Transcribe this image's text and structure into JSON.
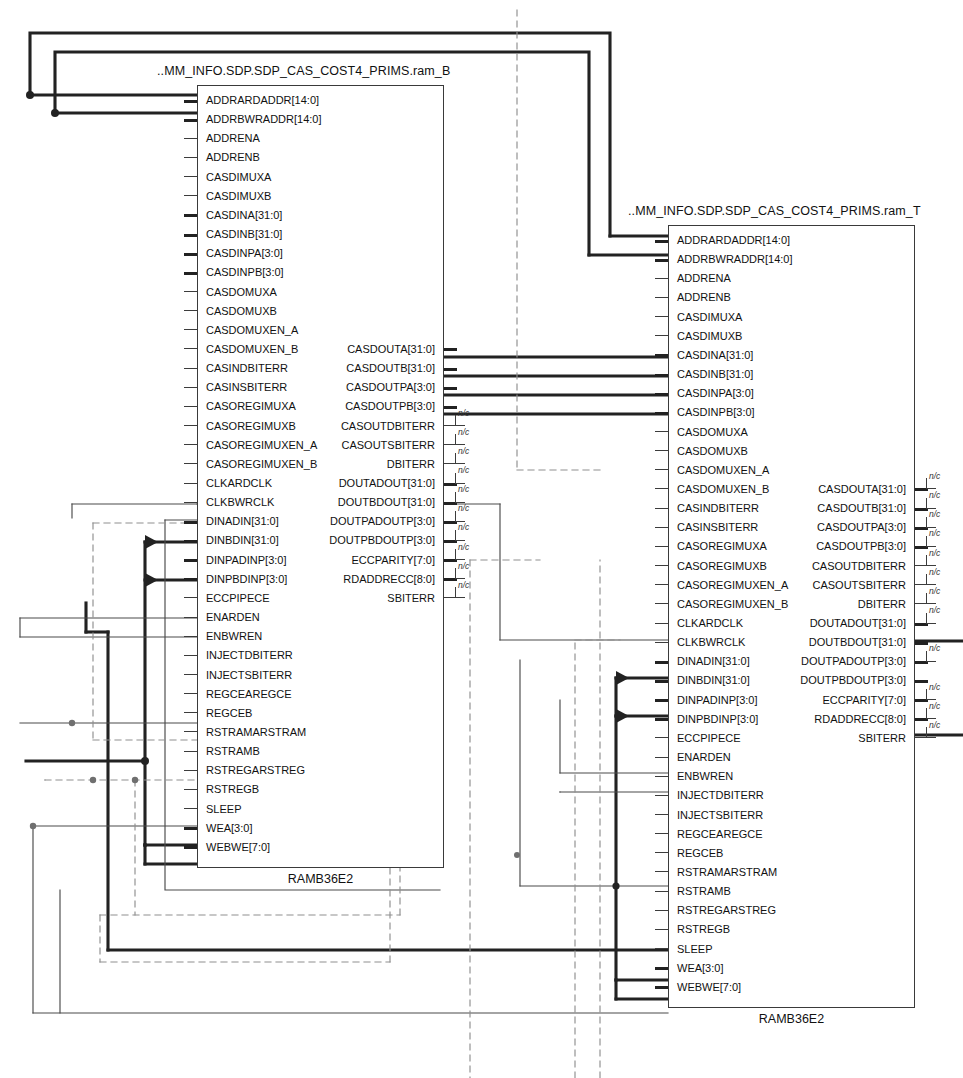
{
  "diagram": {
    "kind": "schematic",
    "tool_view": "RTL / synthesized netlist schematic",
    "cell_type": "RAMB36E2"
  },
  "blocks": [
    {
      "id": "ram_B",
      "title": "..MM_INFO.SDP.SDP_CAS_COST4_PRIMS.ram_B",
      "footer": "RAMB36E2",
      "x": 197,
      "y": 85,
      "w": 247,
      "h": 783,
      "inputs": [
        {
          "name": "ADDRARDADDR[14:0]",
          "bus": true,
          "wired": true
        },
        {
          "name": "ADDRBWRADDR[14:0]",
          "bus": true,
          "wired": true
        },
        {
          "name": "ADDRENA",
          "bus": false,
          "wired": false
        },
        {
          "name": "ADDRENB",
          "bus": false,
          "wired": false
        },
        {
          "name": "CASDIMUXA",
          "bus": false,
          "wired": false
        },
        {
          "name": "CASDIMUXB",
          "bus": false,
          "wired": false
        },
        {
          "name": "CASDINA[31:0]",
          "bus": true,
          "wired": false
        },
        {
          "name": "CASDINB[31:0]",
          "bus": true,
          "wired": false
        },
        {
          "name": "CASDINPA[3:0]",
          "bus": true,
          "wired": false
        },
        {
          "name": "CASDINPB[3:0]",
          "bus": true,
          "wired": false
        },
        {
          "name": "CASDOMUXA",
          "bus": false,
          "wired": false
        },
        {
          "name": "CASDOMUXB",
          "bus": false,
          "wired": false
        },
        {
          "name": "CASDOMUXEN_A",
          "bus": false,
          "wired": false
        },
        {
          "name": "CASDOMUXEN_B",
          "bus": false,
          "wired": false
        },
        {
          "name": "CASINDBITERR",
          "bus": false,
          "wired": false
        },
        {
          "name": "CASINSBITERR",
          "bus": false,
          "wired": false
        },
        {
          "name": "CASOREGIMUXA",
          "bus": false,
          "wired": false
        },
        {
          "name": "CASOREGIMUXB",
          "bus": false,
          "wired": false
        },
        {
          "name": "CASOREGIMUXEN_A",
          "bus": false,
          "wired": false
        },
        {
          "name": "CASOREGIMUXEN_B",
          "bus": false,
          "wired": false
        },
        {
          "name": "CLKARDCLK",
          "bus": false,
          "wired": true
        },
        {
          "name": "CLKBWRCLK",
          "bus": false,
          "wired": true
        },
        {
          "name": "DINADIN[31:0]",
          "bus": true,
          "wired": true
        },
        {
          "name": "DINBDIN[31:0]",
          "bus": true,
          "wired": false
        },
        {
          "name": "DINPADINP[3:0]",
          "bus": true,
          "wired": true
        },
        {
          "name": "DINPBDINP[3:0]",
          "bus": true,
          "wired": false
        },
        {
          "name": "ECCPIPECE",
          "bus": false,
          "wired": false
        },
        {
          "name": "ENARDEN",
          "bus": false,
          "wired": true
        },
        {
          "name": "ENBWREN",
          "bus": false,
          "wired": true
        },
        {
          "name": "INJECTDBITERR",
          "bus": false,
          "wired": false
        },
        {
          "name": "INJECTSBITERR",
          "bus": false,
          "wired": false
        },
        {
          "name": "REGCEAREGCE",
          "bus": false,
          "wired": true
        },
        {
          "name": "REGCEB",
          "bus": false,
          "wired": true
        },
        {
          "name": "RSTRAMARSTRAM",
          "bus": false,
          "wired": true
        },
        {
          "name": "RSTRAMB",
          "bus": false,
          "wired": true
        },
        {
          "name": "RSTREGARSTREG",
          "bus": false,
          "wired": false
        },
        {
          "name": "RSTREGB",
          "bus": false,
          "wired": false
        },
        {
          "name": "SLEEP",
          "bus": false,
          "wired": false
        },
        {
          "name": "WEA[3:0]",
          "bus": true,
          "wired": true
        },
        {
          "name": "WEBWE[7:0]",
          "bus": true,
          "wired": true
        }
      ],
      "outputs": [
        {
          "name": "CASDOUTA[31:0]",
          "row": 13,
          "bus": true,
          "nc": false
        },
        {
          "name": "CASDOUTB[31:0]",
          "row": 14,
          "bus": true,
          "nc": false
        },
        {
          "name": "CASDOUTPA[3:0]",
          "row": 15,
          "bus": true,
          "nc": false
        },
        {
          "name": "CASDOUTPB[3:0]",
          "row": 16,
          "bus": true,
          "nc": false
        },
        {
          "name": "CASOUTDBITERR",
          "row": 17,
          "bus": false,
          "nc": true
        },
        {
          "name": "CASOUTSBITERR",
          "row": 18,
          "bus": false,
          "nc": true
        },
        {
          "name": "DBITERR",
          "row": 19,
          "bus": false,
          "nc": true
        },
        {
          "name": "DOUTADOUT[31:0]",
          "row": 20,
          "bus": true,
          "nc": true
        },
        {
          "name": "DOUTBDOUT[31:0]",
          "row": 21,
          "bus": true,
          "nc": true
        },
        {
          "name": "DOUTPADOUTP[3:0]",
          "row": 22,
          "bus": true,
          "nc": true
        },
        {
          "name": "DOUTPBDOUTP[3:0]",
          "row": 23,
          "bus": true,
          "nc": true
        },
        {
          "name": "ECCPARITY[7:0]",
          "row": 24,
          "bus": true,
          "nc": true
        },
        {
          "name": "RDADDRECC[8:0]",
          "row": 25,
          "bus": true,
          "nc": true
        },
        {
          "name": "SBITERR",
          "row": 26,
          "bus": false,
          "nc": true
        }
      ]
    },
    {
      "id": "ram_T",
      "title": "..MM_INFO.SDP.SDP_CAS_COST4_PRIMS.ram_T",
      "footer": "RAMB36E2",
      "x": 668,
      "y": 225,
      "w": 247,
      "h": 783,
      "inputs": [
        {
          "name": "ADDRARDADDR[14:0]",
          "bus": true,
          "wired": true
        },
        {
          "name": "ADDRBWRADDR[14:0]",
          "bus": true,
          "wired": true
        },
        {
          "name": "ADDRENA",
          "bus": false,
          "wired": false
        },
        {
          "name": "ADDRENB",
          "bus": false,
          "wired": false
        },
        {
          "name": "CASDIMUXA",
          "bus": false,
          "wired": false
        },
        {
          "name": "CASDIMUXB",
          "bus": false,
          "wired": false
        },
        {
          "name": "CASDINA[31:0]",
          "bus": true,
          "wired": true
        },
        {
          "name": "CASDINB[31:0]",
          "bus": true,
          "wired": true
        },
        {
          "name": "CASDINPA[3:0]",
          "bus": true,
          "wired": true
        },
        {
          "name": "CASDINPB[3:0]",
          "bus": true,
          "wired": true
        },
        {
          "name": "CASDOMUXA",
          "bus": false,
          "wired": false
        },
        {
          "name": "CASDOMUXB",
          "bus": false,
          "wired": false
        },
        {
          "name": "CASDOMUXEN_A",
          "bus": false,
          "wired": false
        },
        {
          "name": "CASDOMUXEN_B",
          "bus": false,
          "wired": false
        },
        {
          "name": "CASINDBITERR",
          "bus": false,
          "wired": false
        },
        {
          "name": "CASINSBITERR",
          "bus": false,
          "wired": false
        },
        {
          "name": "CASOREGIMUXA",
          "bus": false,
          "wired": false
        },
        {
          "name": "CASOREGIMUXB",
          "bus": false,
          "wired": false
        },
        {
          "name": "CASOREGIMUXEN_A",
          "bus": false,
          "wired": false
        },
        {
          "name": "CASOREGIMUXEN_B",
          "bus": false,
          "wired": false
        },
        {
          "name": "CLKARDCLK",
          "bus": false,
          "wired": true
        },
        {
          "name": "CLKBWRCLK",
          "bus": false,
          "wired": true
        },
        {
          "name": "DINADIN[31:0]",
          "bus": true,
          "wired": true
        },
        {
          "name": "DINBDIN[31:0]",
          "bus": true,
          "wired": false
        },
        {
          "name": "DINPADINP[3:0]",
          "bus": true,
          "wired": true
        },
        {
          "name": "DINPBDINP[3:0]",
          "bus": true,
          "wired": false
        },
        {
          "name": "ECCPIPECE",
          "bus": false,
          "wired": false
        },
        {
          "name": "ENARDEN",
          "bus": false,
          "wired": true
        },
        {
          "name": "ENBWREN",
          "bus": false,
          "wired": true
        },
        {
          "name": "INJECTDBITERR",
          "bus": false,
          "wired": false
        },
        {
          "name": "INJECTSBITERR",
          "bus": false,
          "wired": false
        },
        {
          "name": "REGCEAREGCE",
          "bus": false,
          "wired": true
        },
        {
          "name": "REGCEB",
          "bus": false,
          "wired": true
        },
        {
          "name": "RSTRAMARSTRAM",
          "bus": false,
          "wired": false
        },
        {
          "name": "RSTRAMB",
          "bus": false,
          "wired": false
        },
        {
          "name": "RSTREGARSTREG",
          "bus": false,
          "wired": false
        },
        {
          "name": "RSTREGB",
          "bus": false,
          "wired": false
        },
        {
          "name": "SLEEP",
          "bus": false,
          "wired": false
        },
        {
          "name": "WEA[3:0]",
          "bus": true,
          "wired": true
        },
        {
          "name": "WEBWE[7:0]",
          "bus": true,
          "wired": true
        }
      ],
      "outputs": [
        {
          "name": "CASDOUTA[31:0]",
          "row": 13,
          "bus": true,
          "nc": true
        },
        {
          "name": "CASDOUTB[31:0]",
          "row": 14,
          "bus": true,
          "nc": true
        },
        {
          "name": "CASDOUTPA[3:0]",
          "row": 15,
          "bus": true,
          "nc": true
        },
        {
          "name": "CASDOUTPB[3:0]",
          "row": 16,
          "bus": true,
          "nc": true
        },
        {
          "name": "CASOUTDBITERR",
          "row": 17,
          "bus": false,
          "nc": true
        },
        {
          "name": "CASOUTSBITERR",
          "row": 18,
          "bus": false,
          "nc": true
        },
        {
          "name": "DBITERR",
          "row": 19,
          "bus": false,
          "nc": true
        },
        {
          "name": "DOUTADOUT[31:0]",
          "row": 20,
          "bus": true,
          "nc": true
        },
        {
          "name": "DOUTBDOUT[31:0]",
          "row": 21,
          "bus": true,
          "nc": false
        },
        {
          "name": "DOUTPADOUTP[3:0]",
          "row": 22,
          "bus": true,
          "nc": true
        },
        {
          "name": "DOUTPBDOUTP[3:0]",
          "row": 23,
          "bus": true,
          "nc": false
        },
        {
          "name": "ECCPARITY[7:0]",
          "row": 24,
          "bus": true,
          "nc": true
        },
        {
          "name": "RDADDRECC[8:0]",
          "row": 25,
          "bus": true,
          "nc": true
        },
        {
          "name": "SBITERR",
          "row": 26,
          "bus": false,
          "nc": true
        }
      ]
    }
  ],
  "labels": {
    "not_connected": "n/c"
  },
  "colors": {
    "background": "#ffffff",
    "block_border": "#3a3a3a",
    "text": "#111111",
    "bus_wire": "#222222",
    "net_wire": "#4a4a4a",
    "dashed_wire": "#8a8a8a",
    "junction": "#222222"
  }
}
